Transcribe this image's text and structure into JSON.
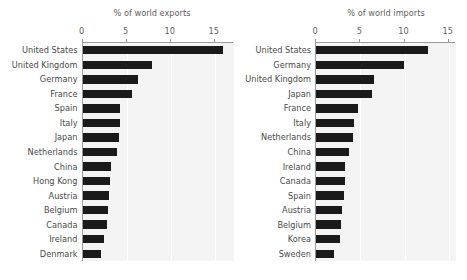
{
  "figure": {
    "background_color": "#ffffff",
    "plot_background_color": "#f4f4f4",
    "bar_color": "#1a1a1a",
    "axis_color": "#9a9a9a",
    "gridline_color": "#ffffff"
  },
  "chart_data": [
    {
      "type": "bar",
      "orientation": "horizontal",
      "title": "% of world exports",
      "xlabel": "",
      "ylabel": "",
      "xlim": [
        0,
        16.6
      ],
      "grid": true,
      "legend": null,
      "xticks": [
        0,
        5,
        10,
        15
      ],
      "xtick_labels": [
        "0",
        "5",
        "10",
        "15"
      ],
      "categories": [
        "United States",
        "United Kingdom",
        "Germany",
        "France",
        "Spain",
        "Italy",
        "Japan",
        "Netherlands",
        "China",
        "Hong Kong",
        "Austria",
        "Belgium",
        "Canada",
        "Ireland",
        "Denmark"
      ],
      "values": [
        15.9,
        7.9,
        6.3,
        5.6,
        4.3,
        4.2,
        4.1,
        3.9,
        3.2,
        3.1,
        3.0,
        2.9,
        2.8,
        2.4,
        2.1
      ]
    },
    {
      "type": "bar",
      "orientation": "horizontal",
      "title": "% of world imports",
      "xlabel": "",
      "ylabel": "",
      "xlim": [
        0,
        16.6
      ],
      "grid": true,
      "legend": null,
      "xticks": [
        0,
        5,
        10,
        15
      ],
      "xtick_labels": [
        "0",
        "5",
        "10",
        "15"
      ],
      "categories": [
        "United States",
        "Germany",
        "United Kingdom",
        "Japan",
        "France",
        "Italy",
        "Netherlands",
        "China",
        "Ireland",
        "Canada",
        "Spain",
        "Austria",
        "Belgium",
        "Korea",
        "Sweden"
      ],
      "values": [
        12.7,
        9.9,
        6.6,
        6.3,
        4.8,
        4.3,
        4.2,
        3.7,
        3.3,
        3.3,
        3.2,
        2.9,
        2.8,
        2.7,
        2.0
      ]
    }
  ]
}
